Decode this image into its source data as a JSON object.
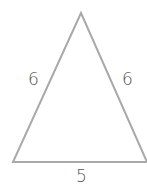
{
  "diagram": {
    "shape": "isosceles triangle",
    "stroke_color": "#a9a9a9",
    "label_color": "#555555",
    "sides": {
      "left": "6",
      "right": "6",
      "base": "5"
    }
  }
}
